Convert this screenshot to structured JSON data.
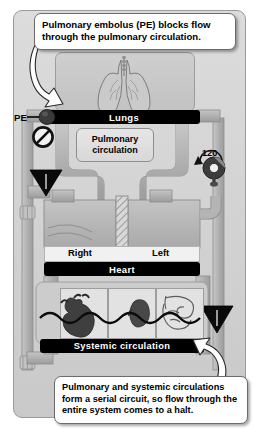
{
  "figure": {
    "type": "physiology-diagram"
  },
  "callouts": {
    "top": "Pulmonary embolus (PE) blocks flow through the pulmonary circulation.",
    "bottom": "Pulmonary and systemic circulations form a serial circuit, so flow through the entire system comes to a halt."
  },
  "labels": {
    "lungs": "Lungs",
    "heart": "Heart",
    "systemic": "Systemic circulation",
    "pulmonary_line1": "Pulmonary",
    "pulmonary_line2": "circulation",
    "right": "Right",
    "left": "Left",
    "pe": "PE",
    "gauge_value": "120"
  },
  "icons": {
    "lungs": "lungs-icon",
    "heart_organ": "heart-organ-icon",
    "kidney": "kidney-icon",
    "intestines": "intestines-icon",
    "embolus": "embolus-icon",
    "no_flow": "prohibition-icon",
    "valve_left": "valve-triangle-icon",
    "valve_right": "valve-triangle-icon",
    "pump": "pump-gauge-icon",
    "arrow_top": "curved-arrow-icon",
    "arrow_bottom": "curved-arrow-icon"
  },
  "colors": {
    "panel_bg": "#d4d4d4",
    "bar_bg": "#000000",
    "bar_text": "#ffffff",
    "pipe": "#b8b8b8",
    "pipe_dark": "#9a9a9a",
    "callout_bg": "#ffffff",
    "outline": "#6b6b6b"
  }
}
